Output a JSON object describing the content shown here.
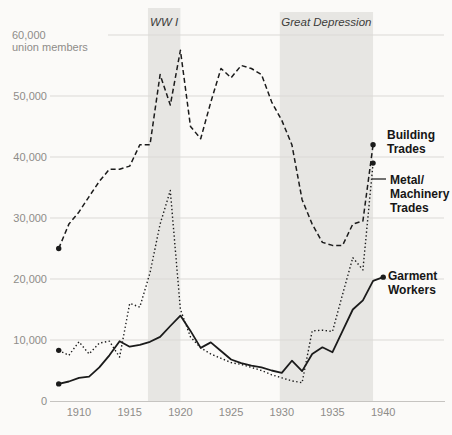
{
  "chart_data": {
    "type": "line",
    "title": "",
    "y_axis": {
      "header_value": "60,000",
      "header_unit": "union members",
      "ticks": [
        {
          "value": 0,
          "label": "0"
        },
        {
          "value": 10000,
          "label": "10,000"
        },
        {
          "value": 20000,
          "label": "20,000"
        },
        {
          "value": 30000,
          "label": "30,000"
        },
        {
          "value": 40000,
          "label": "40,000"
        },
        {
          "value": 50000,
          "label": "50,000"
        }
      ],
      "gridline_values": [
        10000,
        20000,
        30000,
        40000,
        50000,
        60000
      ],
      "range": [
        0,
        60000
      ]
    },
    "x_axis": {
      "ticks": [
        {
          "value": 1910,
          "label": "1910"
        },
        {
          "value": 1915,
          "label": "1915"
        },
        {
          "value": 1920,
          "label": "1920"
        },
        {
          "value": 1925,
          "label": "1925"
        },
        {
          "value": 1930,
          "label": "1930"
        },
        {
          "value": 1935,
          "label": "1935"
        },
        {
          "value": 1940,
          "label": "1940"
        }
      ],
      "range": [
        1907.2,
        1941.5
      ]
    },
    "annotations": [
      {
        "id": "ww1",
        "label": "WW I",
        "year_start": 1916.8,
        "year_end": 1920.0
      },
      {
        "id": "great-depression",
        "label": "Great Depression",
        "year_start": 1929.8,
        "year_end": 1939.0
      }
    ],
    "series": [
      {
        "id": "building-trades",
        "name": "Building Trades",
        "label_lines": [
          "Building",
          "Trades"
        ],
        "line_style": "dashed",
        "points": [
          [
            1908,
            25000
          ],
          [
            1909,
            29000
          ],
          [
            1910,
            31000
          ],
          [
            1911,
            33500
          ],
          [
            1912,
            36000
          ],
          [
            1913,
            38000
          ],
          [
            1914,
            38000
          ],
          [
            1915,
            38500
          ],
          [
            1916,
            42000
          ],
          [
            1917,
            42000
          ],
          [
            1918,
            53500
          ],
          [
            1919,
            48500
          ],
          [
            1920,
            57500
          ],
          [
            1921,
            45000
          ],
          [
            1922,
            43000
          ],
          [
            1923,
            49000
          ],
          [
            1924,
            54500
          ],
          [
            1925,
            53000
          ],
          [
            1926,
            55000
          ],
          [
            1927,
            54500
          ],
          [
            1928,
            53500
          ],
          [
            1929,
            49000
          ],
          [
            1930,
            46000
          ],
          [
            1931,
            42000
          ],
          [
            1932,
            33000
          ],
          [
            1933,
            29000
          ],
          [
            1934,
            26000
          ],
          [
            1935,
            25500
          ],
          [
            1936,
            25500
          ],
          [
            1937,
            29000
          ],
          [
            1938,
            29500
          ],
          [
            1939,
            42000
          ]
        ]
      },
      {
        "id": "metal-machinery-trades",
        "name": "Metal/Machinery Trades",
        "label_lines": [
          "Metal/",
          "Machinery",
          "Trades"
        ],
        "line_style": "dotted",
        "points": [
          [
            1908,
            8300
          ],
          [
            1909,
            7500
          ],
          [
            1910,
            9700
          ],
          [
            1911,
            7700
          ],
          [
            1912,
            9500
          ],
          [
            1913,
            9800
          ],
          [
            1914,
            7200
          ],
          [
            1915,
            16000
          ],
          [
            1916,
            15400
          ],
          [
            1917,
            21000
          ],
          [
            1918,
            29000
          ],
          [
            1919,
            34500
          ],
          [
            1920,
            15000
          ],
          [
            1921,
            10500
          ],
          [
            1922,
            8700
          ],
          [
            1923,
            7700
          ],
          [
            1924,
            7000
          ],
          [
            1925,
            6300
          ],
          [
            1926,
            6000
          ],
          [
            1927,
            5500
          ],
          [
            1928,
            5000
          ],
          [
            1929,
            4300
          ],
          [
            1930,
            3800
          ],
          [
            1931,
            3300
          ],
          [
            1932,
            3000
          ],
          [
            1933,
            11500
          ],
          [
            1934,
            11600
          ],
          [
            1935,
            11400
          ],
          [
            1936,
            17500
          ],
          [
            1937,
            23500
          ],
          [
            1938,
            21500
          ],
          [
            1939,
            39000
          ]
        ]
      },
      {
        "id": "garment-workers",
        "name": "Garment Workers",
        "label_lines": [
          "Garment",
          "Workers"
        ],
        "line_style": "solid",
        "points": [
          [
            1908,
            2800
          ],
          [
            1909,
            3200
          ],
          [
            1910,
            3800
          ],
          [
            1911,
            4000
          ],
          [
            1912,
            5500
          ],
          [
            1913,
            7500
          ],
          [
            1914,
            9800
          ],
          [
            1915,
            8900
          ],
          [
            1916,
            9200
          ],
          [
            1917,
            9700
          ],
          [
            1918,
            10500
          ],
          [
            1919,
            12300
          ],
          [
            1920,
            14000
          ],
          [
            1921,
            11500
          ],
          [
            1922,
            8700
          ],
          [
            1923,
            9600
          ],
          [
            1924,
            8200
          ],
          [
            1925,
            6800
          ],
          [
            1926,
            6200
          ],
          [
            1927,
            5800
          ],
          [
            1928,
            5500
          ],
          [
            1929,
            5000
          ],
          [
            1930,
            4600
          ],
          [
            1931,
            6600
          ],
          [
            1932,
            4900
          ],
          [
            1933,
            7700
          ],
          [
            1934,
            8800
          ],
          [
            1935,
            8000
          ],
          [
            1936,
            11500
          ],
          [
            1937,
            15000
          ],
          [
            1938,
            16500
          ],
          [
            1939,
            19700
          ],
          [
            1940,
            20300
          ]
        ]
      }
    ],
    "colors": {
      "line": "#1b1b1b",
      "grid": "#dbd9d6",
      "axis": "#c6c4c1",
      "tick_text": "#8e8c89",
      "band": "#e7e6e3",
      "band_label": "#3c3c3a",
      "series_label": "#161616",
      "background": "#fbfaf8"
    }
  }
}
